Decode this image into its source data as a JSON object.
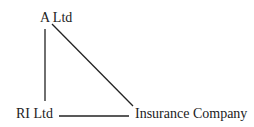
{
  "diagram": {
    "nodes": [
      {
        "id": "a-ltd",
        "label": "A Ltd"
      },
      {
        "id": "ri-ltd",
        "label": "RI Ltd"
      },
      {
        "id": "insurance-company",
        "label": "Insurance Company"
      }
    ],
    "edges": [
      {
        "from": "A Ltd",
        "to": "RI Ltd"
      },
      {
        "from": "A Ltd",
        "to": "Insurance Company"
      },
      {
        "from": "RI Ltd",
        "to": "Insurance Company"
      }
    ],
    "line_color": "#222222"
  }
}
